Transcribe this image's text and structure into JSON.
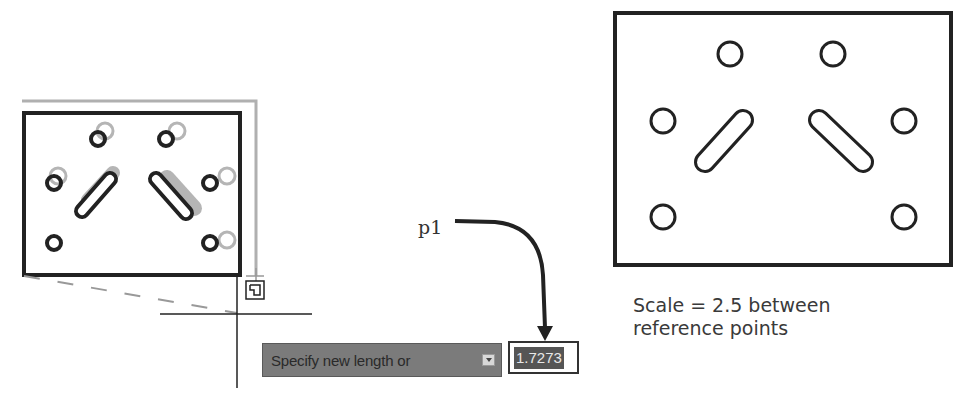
{
  "left_drawing": {
    "name": "plate-being-scaled",
    "preview_state": "ghost-outline-shown"
  },
  "tooltip": {
    "prompt": "Specify new length or",
    "options_icon": "down-arrow-icon"
  },
  "input": {
    "value": "1.7273"
  },
  "callout": {
    "label": "p1"
  },
  "right_drawing": {
    "name": "plate-scaled-result"
  },
  "caption": {
    "line1": "Scale = 2.5 between",
    "line2": "reference points"
  },
  "colors": {
    "outline": "#222222",
    "ghost": "#aaaaaa",
    "tooltip_bg": "#7b7b7b",
    "selection_bg": "#555555"
  }
}
